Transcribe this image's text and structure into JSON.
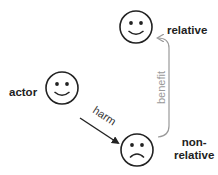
{
  "nodes": {
    "actor": {
      "label": "actor",
      "expression": "smile"
    },
    "relative": {
      "label": "relative",
      "expression": "smile"
    },
    "nonrelative": {
      "label_line1": "non-",
      "label_line2": "relative",
      "expression": "frown"
    }
  },
  "edges": {
    "harm": {
      "label": "harm",
      "from": "actor",
      "to": "non-relative",
      "color": "#222222"
    },
    "benefit": {
      "label": "benefit",
      "from": "non-relative",
      "to": "relative",
      "color": "#9a9a9a"
    }
  }
}
